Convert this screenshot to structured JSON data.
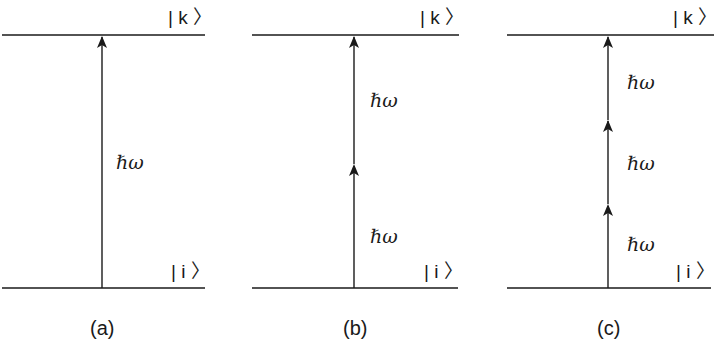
{
  "figure": {
    "panels": [
      {
        "caption": "(a)",
        "upper_state": "| k 〉",
        "lower_state": "| i 〉",
        "photon_label": "ℏω",
        "photon_count": 1,
        "photon_labels": [
          "ℏω"
        ]
      },
      {
        "caption": "(b)",
        "upper_state": "| k 〉",
        "lower_state": "| i 〉",
        "photon_label": "ℏω",
        "photon_count": 2,
        "photon_labels": [
          "ℏω",
          "ℏω"
        ]
      },
      {
        "caption": "(c)",
        "upper_state": "| k 〉",
        "lower_state": "| i 〉",
        "photon_label": "ℏω",
        "photon_count": 3,
        "photon_labels": [
          "ℏω",
          "ℏω",
          "ℏω"
        ]
      }
    ],
    "colors": {
      "line": "#1a1a1a",
      "background": "#ffffff"
    }
  }
}
